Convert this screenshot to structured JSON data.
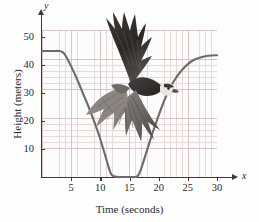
{
  "figure": {
    "axis_variable_y": "y",
    "axis_variable_x": "x",
    "title_x": "Time (seconds)",
    "title_y": "Height (meters)",
    "curve_color": "#6b6b6b",
    "grid_color": "#e9dada",
    "grid_major_color": "#d8c4c4",
    "axis_color": "#3a3a3a",
    "illustration": "osprey-bird-in-flight"
  },
  "chart_data": {
    "type": "line",
    "title": "",
    "xlabel": "Time (seconds)",
    "ylabel": "Height (meters)",
    "xlim": [
      0,
      30
    ],
    "ylim": [
      0,
      52.5
    ],
    "xticks": [
      5,
      10,
      15,
      20,
      25,
      30
    ],
    "yticks": [
      10,
      20,
      30,
      40,
      50
    ],
    "grid": true,
    "legend": "none",
    "series": [
      {
        "name": "Height",
        "x": [
          0,
          1,
          2,
          3,
          3.5,
          4,
          5,
          6,
          7,
          8,
          9,
          10,
          11,
          11.5,
          12,
          13,
          14,
          15,
          16,
          16.5,
          17,
          18,
          19,
          20,
          21,
          22,
          23,
          24,
          25,
          26,
          27,
          28,
          29,
          30
        ],
        "y": [
          45,
          45,
          45,
          45,
          44.6,
          43.5,
          39.5,
          35,
          30,
          25,
          19.5,
          13.5,
          6.5,
          3,
          0.6,
          0,
          0,
          0,
          0,
          0.6,
          3,
          9.5,
          16,
          22,
          27.5,
          32,
          35.5,
          38.2,
          40.3,
          41.8,
          42.6,
          43.1,
          43.4,
          43.5
        ]
      }
    ],
    "annotations": [
      {
        "text": "flat cruise at 45 m from t = 0 to t ≈ 3.5 s"
      },
      {
        "text": "dive to 0 m between t ≈ 12 s and t ≈ 16.5 s"
      },
      {
        "text": "climb back to ≈ 43.5 m at t = 30 s"
      }
    ]
  },
  "ticks": {
    "x": [
      {
        "value": 5,
        "label": "5"
      },
      {
        "value": 10,
        "label": "10"
      },
      {
        "value": 15,
        "label": "15"
      },
      {
        "value": 20,
        "label": "20"
      },
      {
        "value": 25,
        "label": "25"
      },
      {
        "value": 30,
        "label": "30"
      }
    ],
    "y": [
      {
        "value": 10,
        "label": "10"
      },
      {
        "value": 20,
        "label": "20"
      },
      {
        "value": 30,
        "label": "30"
      },
      {
        "value": 40,
        "label": "40"
      },
      {
        "value": 50,
        "label": "50"
      }
    ]
  }
}
